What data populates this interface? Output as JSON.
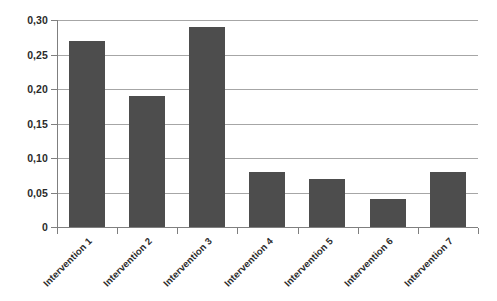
{
  "chart_data": {
    "type": "bar",
    "title": "",
    "subtitle": "",
    "xlabel": "",
    "ylabel": "",
    "categories": [
      "Intervention 1",
      "Intervention 2",
      "Intervention 3",
      "Intervention 4",
      "Intervention 5",
      "Intervention 6",
      "Intervention 7"
    ],
    "values": [
      0.27,
      0.19,
      0.29,
      0.08,
      0.07,
      0.04,
      0.08
    ],
    "ylim": [
      0,
      0.3
    ],
    "ytick_values": [
      0,
      0.05,
      0.1,
      0.15,
      0.2,
      0.25,
      0.3
    ],
    "ytick_labels": [
      "0",
      "0,05",
      "0,10",
      "0,15",
      "0,20",
      "0,25",
      "0,30"
    ],
    "grid": true,
    "grid_axis": "y",
    "legend": false,
    "legend_position": "none",
    "bar_color": "#4d4d4d",
    "gridline_color": "#a6a6a6",
    "axis_color": "#7f7f7f",
    "text_color": "#2b2b2b",
    "background_color": "#ffffff",
    "xtick_label_rotation": -45,
    "decimal_separator": ","
  }
}
